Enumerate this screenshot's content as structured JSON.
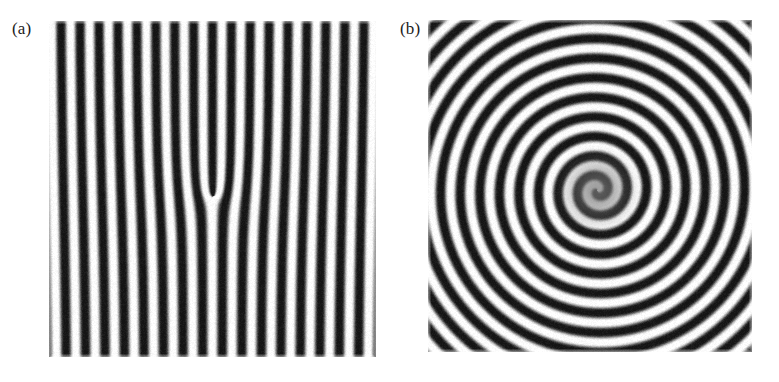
{
  "figure": {
    "kind": "scientific-figure",
    "background_color": "#ffffff",
    "width": 779,
    "height": 382,
    "panel_count": 2
  },
  "panels": [
    {
      "id": "a",
      "label": "(a)",
      "description": "straight parallel roll pattern containing a single dislocation defect",
      "image": {
        "x": 49,
        "y": 21,
        "width": 327,
        "height": 336,
        "type": "stripe-rolls-with-dislocation",
        "wavelength_px": 19.2,
        "orientation_deg": 90,
        "defect": {
          "type": "dislocation",
          "cx": 213,
          "cy": 196,
          "burgers_sign": 1
        },
        "grayscale": {
          "min_hex": "#141414",
          "max_hex": "#ffffff",
          "gamma": 1.0
        },
        "noise_amplitude": 0.085,
        "edge_fade_px": 3
      }
    },
    {
      "id": "b",
      "label": "(b)",
      "description": "single-armed rotating spiral wave pattern",
      "image": {
        "x": 428,
        "y": 20,
        "width": 324,
        "height": 332,
        "type": "spiral-wave",
        "wavelength_px": 19.6,
        "arms": 1,
        "chirality": "counterclockwise",
        "core": {
          "cx": 597,
          "cy": 190
        },
        "core_amplitude_radius_px": 26,
        "grayscale": {
          "min_hex": "#141414",
          "max_hex": "#ffffff",
          "gamma": 1.0
        },
        "noise_amplitude": 0.085,
        "edge_fade_px": 3
      }
    }
  ],
  "chart_data": {
    "type": "heatmap",
    "title": "",
    "xlabel": "",
    "ylabel": "",
    "grid": false,
    "legend": null,
    "subplots": [
      {
        "name": "(a)",
        "field": "amplitude",
        "colormap": "grayscale",
        "value_range": [
          0,
          1
        ],
        "pattern": "cos(k*x + dislocation phase)",
        "k_px": 0.327,
        "wavelength_px": 19.2,
        "stripe_count_visible": 17,
        "defect_type": "dislocation",
        "defect_position_px": [
          164,
          175
        ]
      },
      {
        "name": "(b)",
        "field": "amplitude",
        "colormap": "grayscale",
        "value_range": [
          0,
          1
        ],
        "pattern": "cos(k*r + m*theta)",
        "k_px": 0.32,
        "wavelength_px": 19.6,
        "topological_charge": 1,
        "ring_count_visible": 9,
        "core_position_px": [
          169,
          170
        ]
      }
    ]
  }
}
